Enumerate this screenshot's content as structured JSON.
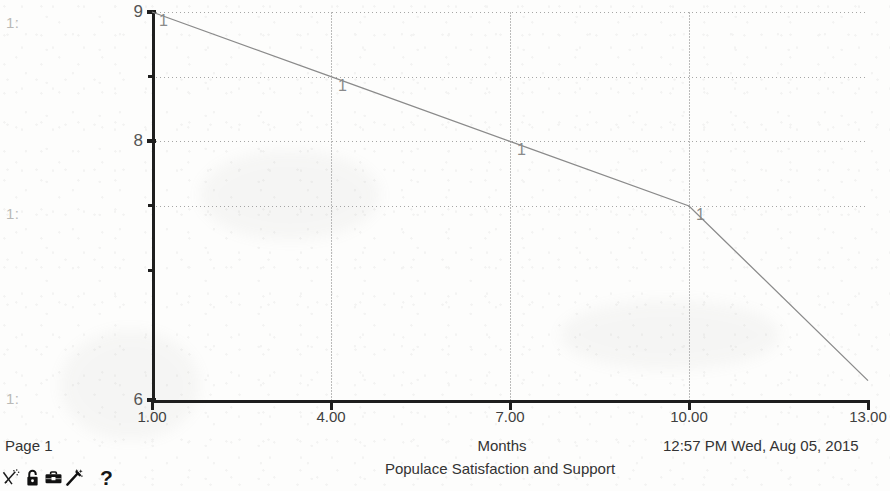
{
  "document": {
    "page_label": "Page 1",
    "timestamp": "12:57 PM  Wed, Aug 05, 2015",
    "margin_marks": [
      "1:",
      "1:",
      "1:"
    ]
  },
  "toolbar": {
    "icons": [
      {
        "name": "no-draw-icon",
        "label": ""
      },
      {
        "name": "lock-icon",
        "label": ""
      },
      {
        "name": "toolbox-icon",
        "label": ""
      },
      {
        "name": "magic-wand-icon",
        "label": ""
      }
    ],
    "help_label": "?"
  },
  "colors": {
    "axis": "#1e1e1e",
    "grid": "#8d8d8d",
    "series": "#8a8a8a",
    "page_background": "#fdfdfc",
    "text": "#333333"
  },
  "chart_data": {
    "type": "line",
    "title": "Populace Satisfaction and Support",
    "xlabel": "Months",
    "ylabel": "",
    "xlim": [
      1,
      13
    ],
    "ylim": [
      6,
      9
    ],
    "grid": true,
    "legend": "none",
    "x_ticks": [
      {
        "value": 1,
        "label": "1.00"
      },
      {
        "value": 4,
        "label": "4.00"
      },
      {
        "value": 7,
        "label": "7.00"
      },
      {
        "value": 10,
        "label": "10.00"
      },
      {
        "value": 13,
        "label": "13.00"
      }
    ],
    "y_ticks": [
      {
        "value": 9,
        "label": "9",
        "major": true
      },
      {
        "value": 8.5,
        "label": "",
        "major": false
      },
      {
        "value": 8,
        "label": "8",
        "major": true
      },
      {
        "value": 7.5,
        "label": "",
        "major": false
      },
      {
        "value": 7,
        "label": "",
        "major": false
      },
      {
        "value": 6,
        "label": "6",
        "major": true
      }
    ],
    "gridlines_h": [
      9,
      8.5,
      8,
      7.5
    ],
    "gridlines_v": [
      4,
      7,
      10
    ],
    "series": [
      {
        "name": "1",
        "marker_label": "1",
        "x": [
          1,
          4,
          7,
          10,
          13
        ],
        "values": [
          9.0,
          8.5,
          8.0,
          7.5,
          6.15
        ]
      }
    ],
    "markers": [
      {
        "x": 1,
        "y": 9.0,
        "label": "1"
      },
      {
        "x": 4,
        "y": 8.5,
        "label": "1"
      },
      {
        "x": 7,
        "y": 8.0,
        "label": "1"
      },
      {
        "x": 10,
        "y": 7.5,
        "label": "1"
      }
    ]
  }
}
